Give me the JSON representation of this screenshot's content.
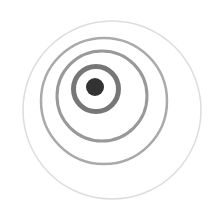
{
  "canvas": {
    "width": 223,
    "height": 208,
    "background": "#ffffff"
  },
  "figure": {
    "dot": {
      "cx": 95,
      "cy": 87,
      "r": 9,
      "color": "#333333"
    },
    "rings": [
      {
        "cx": 96,
        "cy": 89,
        "r": 22.5,
        "stroke": "#777777",
        "width": 5
      },
      {
        "cx": 102,
        "cy": 96,
        "r": 45,
        "stroke": "#999999",
        "width": 3
      },
      {
        "cx": 104,
        "cy": 101,
        "r": 63,
        "stroke": "#aaaaaa",
        "width": 2.5
      },
      {
        "cx": 112,
        "cy": 110,
        "r": 89,
        "stroke": "#dddddd",
        "width": 1.5
      }
    ]
  }
}
